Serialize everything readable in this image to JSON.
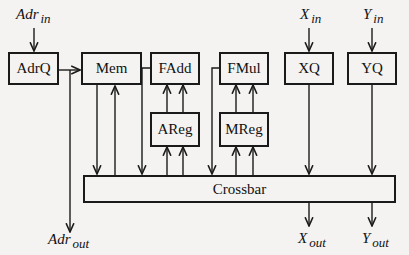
{
  "diagram": {
    "type": "block-diagram",
    "blocks": {
      "adrq": "AdrQ",
      "mem": "Mem",
      "fadd": "FAdd",
      "fmul": "FMul",
      "areg": "AReg",
      "mreg": "MReg",
      "xq": "XQ",
      "yq": "YQ",
      "crossbar": "Crossbar"
    },
    "io_labels": {
      "adr_in": {
        "base": "Adr",
        "sub": "in"
      },
      "x_in": {
        "base": "X",
        "sub": "in"
      },
      "y_in": {
        "base": "Y",
        "sub": "in"
      },
      "adr_out": {
        "base": "Adr",
        "sub": "out"
      },
      "x_out": {
        "base": "X",
        "sub": "out"
      },
      "y_out": {
        "base": "Y",
        "sub": "out"
      }
    },
    "connections": [
      {
        "from": "Adr_in",
        "to": "AdrQ"
      },
      {
        "from": "AdrQ",
        "to": "Mem"
      },
      {
        "from": "AdrQ",
        "to": "Adr_out"
      },
      {
        "from": "Mem",
        "to": "Crossbar"
      },
      {
        "from": "Crossbar",
        "to": "Mem"
      },
      {
        "from": "FAdd",
        "to": "Crossbar"
      },
      {
        "from": "AReg",
        "to": "FAdd"
      },
      {
        "from": "Crossbar",
        "to": "AReg"
      },
      {
        "from": "FMul",
        "to": "Crossbar"
      },
      {
        "from": "MReg",
        "to": "FMul"
      },
      {
        "from": "Crossbar",
        "to": "MReg"
      },
      {
        "from": "X_in",
        "to": "XQ"
      },
      {
        "from": "XQ",
        "to": "Crossbar"
      },
      {
        "from": "Y_in",
        "to": "YQ"
      },
      {
        "from": "YQ",
        "to": "Crossbar"
      },
      {
        "from": "Crossbar",
        "to": "X_out"
      },
      {
        "from": "Crossbar",
        "to": "Y_out"
      }
    ],
    "colors": {
      "line": "#1a1a1a",
      "background": "#f4f3f1"
    }
  }
}
